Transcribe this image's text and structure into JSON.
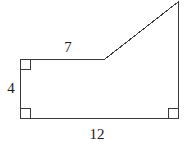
{
  "figure": {
    "kind": "polygon-geometry-diagram",
    "stroke_color": "#3a3a3a",
    "background_color": "#ffffff",
    "label_color": "#1c1c1c",
    "stroke_width": 1,
    "canvas": {
      "width": 189,
      "height": 146
    },
    "vertices": [
      {
        "name": "top-left",
        "x": 20,
        "y": 59
      },
      {
        "name": "top-middle-junction",
        "x": 105,
        "y": 59
      },
      {
        "name": "top-right-apex",
        "x": 178,
        "y": 2
      },
      {
        "name": "bottom-right",
        "x": 178,
        "y": 118
      },
      {
        "name": "bottom-left",
        "x": 20,
        "y": 118
      }
    ],
    "outline_points": "20,59 105,59 178,2 178,118 20,118 20,59",
    "right_angle_markers": [
      {
        "name": "top-left-right-angle",
        "x": 20,
        "y": 59,
        "dx": 1,
        "dy": 1,
        "size": 10
      },
      {
        "name": "bottom-left-right-angle",
        "x": 20,
        "y": 118,
        "dx": 1,
        "dy": -1,
        "size": 10
      },
      {
        "name": "bottom-right-right-angle",
        "x": 178,
        "y": 118,
        "dx": -1,
        "dy": -1,
        "size": 10
      }
    ],
    "labels": {
      "top": "7",
      "left": "4",
      "bottom": "12"
    }
  }
}
